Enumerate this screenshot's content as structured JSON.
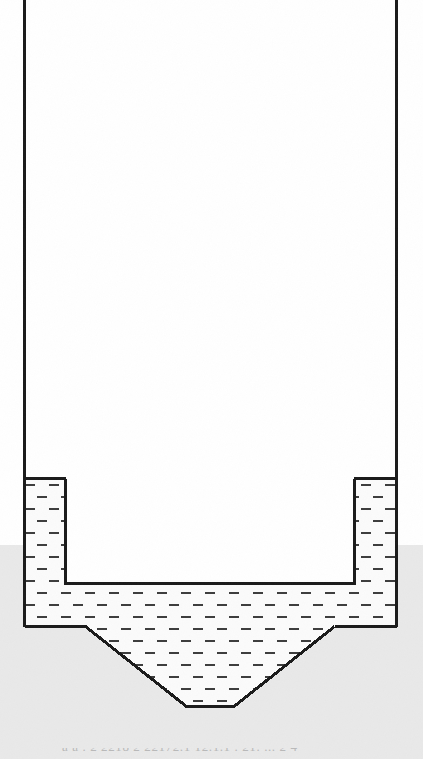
{
  "figure": {
    "kind": "technical-line-drawing",
    "caption_partial": "a a . 2  2218 2 22172.1 12.1.1 . 21. ... 2 4",
    "colors": {
      "line": "#1a1a1a",
      "paper_upper": "#ffffff",
      "paper_lower": "#e9e9e9",
      "liquid_fill": "#fbfbfb",
      "hatch": "#3c3c3c",
      "caption": "#b9b9b9"
    },
    "geometry": {
      "left_wall_x": 23,
      "right_wall_x": 397,
      "wall_top_y": 0,
      "vessel_floor_y": 627,
      "wall_thickness": 3,
      "insert_left_x": 65,
      "insert_right_x": 355,
      "insert_bottom_y": 584,
      "liquid_surface_y": 479,
      "hopper_left_break_x": 85,
      "hopper_right_break_x": 335,
      "hopper_outlet_left_x": 186,
      "hopper_outlet_right_x": 234,
      "hopper_outlet_y": 707
    },
    "hatch": {
      "dash_width": 10,
      "dash_height": 2,
      "row_spacing": 12,
      "col_spacing": 24,
      "row_offset": 12
    }
  },
  "labels": {
    "left_wall": "left-vessel-wall",
    "right_wall": "right-vessel-wall",
    "insert": "central-insert-body",
    "hopper": "conical-hopper-section",
    "outlet": "hopper-outlet",
    "liquid": "hatched-liquid-region",
    "headspace": "vessel-headspace"
  }
}
